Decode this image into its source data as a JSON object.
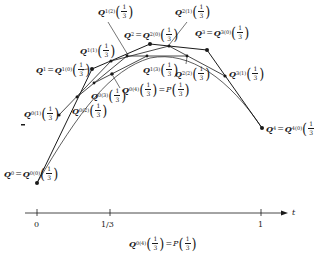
{
  "diagram": {
    "type": "de Casteljau construction of a Bezier curve",
    "parameter_value": "1/3",
    "control_points": [
      {
        "name": "Q_0",
        "label_base": "Q",
        "sub": "0",
        "alias_sub": "0",
        "alias_sup": "(0)",
        "x": 37,
        "y": 183
      },
      {
        "name": "Q_1",
        "label_base": "Q",
        "sub": "1",
        "alias_sub": "1",
        "alias_sup": "(0)",
        "x": 92,
        "y": 69
      },
      {
        "name": "Q_2",
        "label_base": "Q",
        "sub": "2",
        "alias_sub": "2",
        "alias_sup": "(0)",
        "x": 150,
        "y": 44
      },
      {
        "name": "Q_3",
        "label_base": "Q",
        "sub": "3",
        "alias_sub": "3",
        "alias_sup": "(0)",
        "x": 207,
        "y": 50
      },
      {
        "name": "Q_4",
        "label_base": "Q",
        "sub": "4",
        "alias_sub": "4",
        "alias_sup": "(0)",
        "x": 262,
        "y": 128
      }
    ],
    "level1_points": [
      {
        "sub": "0",
        "sup": "(1)",
        "x": 59,
        "y": 115
      },
      {
        "sub": "1",
        "sup": "(1)",
        "x": 111,
        "y": 61
      },
      {
        "sub": "2",
        "sup": "(1)",
        "x": 169,
        "y": 46
      },
      {
        "sub": "3",
        "sup": "(1)",
        "x": 225,
        "y": 76
      }
    ],
    "level2_points": [
      {
        "sub": "0",
        "sup": "(2)",
        "x": 77,
        "y": 97
      },
      {
        "sub": "1",
        "sup": "(2)",
        "x": 127,
        "y": 56
      },
      {
        "sub": "2",
        "sup": "(2)",
        "x": 187,
        "y": 56
      }
    ],
    "level3_points": [
      {
        "sub": "0",
        "sup": "(3)",
        "x": 94,
        "y": 83
      },
      {
        "sub": "1",
        "sup": "(3)",
        "x": 147,
        "y": 56
      }
    ],
    "level4_point": {
      "sub": "0",
      "sup": "(4)",
      "x": 112,
      "y": 74
    },
    "labels": {
      "Q": "Q",
      "P": "P",
      "equals": "=",
      "frac_num": "1",
      "frac_den": "3",
      "lparen": "(",
      "rparen": ")"
    }
  },
  "axis": {
    "variable": "t",
    "ticks": [
      {
        "label": "0",
        "x": 37
      },
      {
        "label": "1/3",
        "x": 110
      },
      {
        "label": "1",
        "x": 261
      }
    ]
  },
  "caption": {
    "sub": "0",
    "sup": "(4)"
  }
}
